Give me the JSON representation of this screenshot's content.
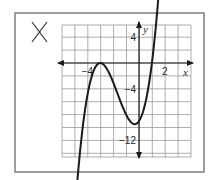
{
  "mark": {
    "symbol": "X",
    "meaning": "incorrect"
  },
  "chart_data": {
    "type": "line",
    "title": "",
    "xlabel": "x",
    "ylabel": "y",
    "xlim": [
      -6,
      4
    ],
    "ylim": [
      -14,
      6
    ],
    "grid": true,
    "x_grid_step": 1,
    "y_grid_step": 2,
    "x_tick_labels": [
      {
        "value": -4,
        "label": "−4"
      },
      {
        "value": 2,
        "label": "2"
      }
    ],
    "y_tick_labels": [
      {
        "value": 4,
        "label": "4"
      },
      {
        "value": -4,
        "label": "−4"
      },
      {
        "value": -12,
        "label": "−12"
      }
    ],
    "series": [
      {
        "name": "f(x) = (x + 3)^2 (x - 1)",
        "description": "Cubic polynomial; arrows on both ends",
        "key_points": {
          "x_intercepts": [
            -3,
            1
          ],
          "local_max": [
            -3,
            0
          ],
          "local_min": [
            -0.33,
            -9.48
          ],
          "y_intercept": [
            0,
            -9
          ]
        },
        "x": [
          -5.2,
          -5,
          -4.5,
          -4,
          -3.5,
          -3,
          -2.5,
          -2,
          -1.5,
          -1,
          -0.5,
          -0.33,
          0,
          0.5,
          1,
          1.5,
          1.85
        ],
        "y": [
          -14.1,
          -12,
          -6.75,
          -5,
          -1.13,
          0,
          -0.88,
          -3,
          -5.63,
          -8,
          -9.38,
          -9.48,
          -9,
          -6.13,
          0,
          10.13,
          18.8
        ]
      }
    ]
  }
}
